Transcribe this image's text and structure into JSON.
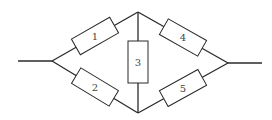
{
  "diagram": {
    "type": "bridge-circuit",
    "colors": {
      "line": "#2a2a2a",
      "label": "#444444",
      "background": "#ffffff"
    },
    "nodes": [
      {
        "id": "left",
        "x": 52,
        "y": 61
      },
      {
        "id": "top",
        "x": 138,
        "y": 12
      },
      {
        "id": "bottom",
        "x": 138,
        "y": 113
      },
      {
        "id": "right",
        "x": 228,
        "y": 63
      }
    ],
    "terminals": [
      {
        "id": "input",
        "from": [
          18,
          61
        ],
        "to": [
          52,
          61
        ]
      },
      {
        "id": "output",
        "from": [
          228,
          63
        ],
        "to": [
          262,
          63
        ]
      }
    ],
    "resistors": [
      {
        "label": "1",
        "between": [
          "left",
          "top"
        ]
      },
      {
        "label": "2",
        "between": [
          "left",
          "bottom"
        ]
      },
      {
        "label": "3",
        "between": [
          "top",
          "bottom"
        ]
      },
      {
        "label": "4",
        "between": [
          "top",
          "right"
        ]
      },
      {
        "label": "5",
        "between": [
          "bottom",
          "right"
        ]
      }
    ]
  }
}
